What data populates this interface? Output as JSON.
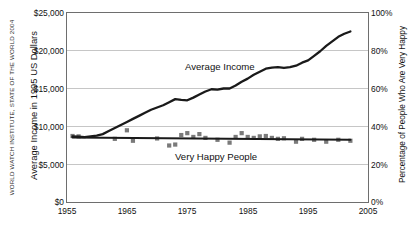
{
  "credit": "World Watch Institute, State of the World 2004",
  "axes": {
    "left_title": "Average Income in 1995 US Dollars",
    "right_title": "Percentage of People Who Are Very Happy",
    "left_ticks": [
      "$25,000",
      "$20,000",
      "$15,000",
      "$10,000",
      "$5,000",
      "$0"
    ],
    "right_ticks": [
      "100%",
      "80%",
      "60%",
      "40%",
      "20%",
      "0%"
    ],
    "x_ticks": [
      "1955",
      "1965",
      "1975",
      "1985",
      "1995",
      "2005"
    ]
  },
  "series_labels": {
    "income": "Average Income",
    "happy": "Very Happy People"
  },
  "colors": {
    "line": "#1a1a1a",
    "marker": "#7a7a7a",
    "grid": "#b8b8b8",
    "frame": "#6e6e6e",
    "text": "#111111"
  },
  "chart_data": {
    "type": "line",
    "title": "",
    "subtitle": "",
    "xlabel": "",
    "ylabel": "Average Income in 1995 US Dollars",
    "y2label": "Percentage of People Who Are Very Happy",
    "xlim": [
      1955,
      2005
    ],
    "ylim": [
      0,
      25000
    ],
    "y2lim": [
      0,
      100
    ],
    "grid": true,
    "legend": "inline-annotations",
    "series": [
      {
        "name": "Average Income",
        "type": "line",
        "axis": "left",
        "unit": "1995 US Dollars",
        "x": [
          1956,
          1957,
          1958,
          1959,
          1960,
          1961,
          1962,
          1963,
          1964,
          1965,
          1966,
          1967,
          1968,
          1969,
          1970,
          1971,
          1972,
          1973,
          1974,
          1975,
          1976,
          1977,
          1978,
          1979,
          1980,
          1981,
          1982,
          1983,
          1984,
          1985,
          1986,
          1987,
          1988,
          1989,
          1990,
          1991,
          1992,
          1993,
          1994,
          1995,
          1996,
          1997,
          1998,
          1999,
          2000,
          2001,
          2002
        ],
        "y": [
          8700,
          8650,
          8600,
          8700,
          8800,
          9000,
          9400,
          9800,
          10200,
          10600,
          11000,
          11400,
          11800,
          12200,
          12500,
          12800,
          13200,
          13600,
          13500,
          13450,
          13800,
          14200,
          14600,
          14900,
          14850,
          15000,
          15000,
          15400,
          15900,
          16300,
          16800,
          17200,
          17600,
          17750,
          17800,
          17700,
          17800,
          18000,
          18400,
          18700,
          19300,
          19900,
          20600,
          21200,
          21800,
          22200,
          22500
        ]
      },
      {
        "name": "Very Happy People",
        "type": "scatter-with-trend",
        "axis": "right",
        "unit": "percent",
        "x": [
          1956,
          1957,
          1963,
          1965,
          1966,
          1970,
          1972,
          1973,
          1974,
          1975,
          1976,
          1977,
          1978,
          1980,
          1982,
          1983,
          1984,
          1985,
          1986,
          1987,
          1988,
          1989,
          1990,
          1991,
          1993,
          1994,
          1996,
          1998,
          2000,
          2002
        ],
        "y": [
          35.0,
          34.8,
          33.5,
          38.0,
          32.5,
          33.7,
          30.0,
          30.5,
          35.5,
          36.5,
          34.5,
          36.0,
          34.0,
          33.0,
          31.5,
          34.5,
          36.5,
          34.5,
          34.0,
          34.8,
          35.0,
          34.0,
          33.5,
          33.8,
          32.0,
          33.5,
          33.0,
          32.0,
          33.0,
          32.5
        ],
        "trend": {
          "x": [
            1956,
            2002
          ],
          "y": [
            34.2,
            33.0
          ]
        }
      }
    ]
  }
}
